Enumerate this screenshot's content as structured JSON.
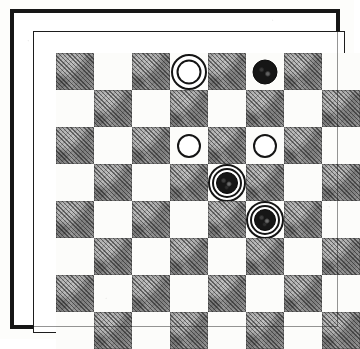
{
  "figure": {
    "kind": "checkers-position-diagram",
    "board_size": 8,
    "orientation_note": "columns 1-8 left to right, rows 1-8 top to bottom",
    "dark_square_rule": "dark when (row + column) is even",
    "colors": {
      "light_square": "#fcfcfa",
      "dark_square": "#9a9a9a",
      "ink": "#141414",
      "paper": "#ffffff",
      "border": "#171717"
    },
    "counts": {
      "white_men": 2,
      "white_kings": 1,
      "black_men": 1,
      "black_kings": 2,
      "total_pieces": 6
    }
  },
  "chart_data": {
    "type": "table",
    "xlabel": "column",
    "ylabel": "row",
    "categories": [
      "1",
      "2",
      "3",
      "4",
      "5",
      "6",
      "7",
      "8"
    ],
    "pieces": [
      {
        "row": 1,
        "col": 4,
        "color": "white",
        "rank": "king",
        "square": "light"
      },
      {
        "row": 1,
        "col": 6,
        "color": "black",
        "rank": "man",
        "square": "light"
      },
      {
        "row": 3,
        "col": 4,
        "color": "white",
        "rank": "man",
        "square": "light"
      },
      {
        "row": 3,
        "col": 6,
        "color": "white",
        "rank": "man",
        "square": "light"
      },
      {
        "row": 4,
        "col": 5,
        "color": "black",
        "rank": "king",
        "square": "light"
      },
      {
        "row": 5,
        "col": 6,
        "color": "black",
        "rank": "king",
        "square": "light"
      }
    ]
  }
}
